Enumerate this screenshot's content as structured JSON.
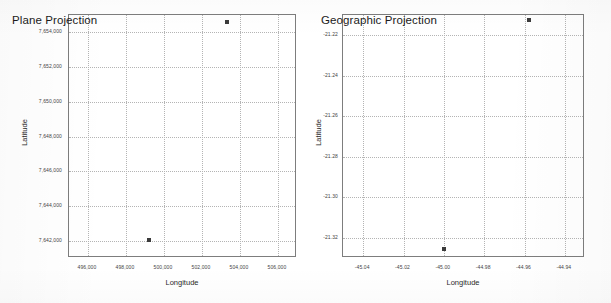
{
  "chart_data": [
    {
      "type": "scatter",
      "title": "Plane Projection",
      "xlabel": "Longitude",
      "ylabel": "Latitude",
      "grid": true,
      "legend": "none",
      "xlim": [
        495000,
        507000
      ],
      "ylim": [
        7641000,
        7655000
      ],
      "xticks": [
        "496,000",
        "498,000",
        "500,000",
        "502,000",
        "504,000",
        "506,000"
      ],
      "xtick_values": [
        496000,
        498000,
        500000,
        502000,
        504000,
        506000
      ],
      "yticks": [
        "7,654,000",
        "7,652,000",
        "7,650,000",
        "7,648,000",
        "7,646,000",
        "7,644,000",
        "7,642,000"
      ],
      "ytick_values": [
        7654000,
        7652000,
        7650000,
        7648000,
        7646000,
        7644000,
        7642000
      ],
      "points": [
        {
          "x": 503300,
          "y": 7654600
        },
        {
          "x": 499200,
          "y": 7642050
        }
      ]
    },
    {
      "type": "scatter",
      "title": "Geographic Projection",
      "xlabel": "Longitude",
      "ylabel": "Latitude",
      "grid": true,
      "legend": "none",
      "xlim": [
        -45.05,
        -44.93
      ],
      "ylim": [
        -21.33,
        -21.21
      ],
      "xticks": [
        "-45.04",
        "-45.02",
        "-45.00",
        "-44.98",
        "-44.96",
        "-44.94"
      ],
      "xtick_values": [
        -45.04,
        -45.02,
        -45.0,
        -44.98,
        -44.96,
        -44.94
      ],
      "yticks": [
        "-21.22",
        "-21.24",
        "-21.26",
        "-21.28",
        "-21.30",
        "-21.32"
      ],
      "ytick_values": [
        -21.22,
        -21.24,
        -21.26,
        -21.28,
        -21.3,
        -21.32
      ],
      "points": [
        {
          "x": -44.958,
          "y": -21.2125
        },
        {
          "x": -45.0,
          "y": -21.3255
        }
      ]
    }
  ],
  "panels": {
    "left": {
      "title": "Plane Projection",
      "xlabel": "Longitude",
      "ylabel": "Latitude"
    },
    "right": {
      "title": "Geographic Projection",
      "xlabel": "Longitude",
      "ylabel": "Latitude"
    }
  }
}
